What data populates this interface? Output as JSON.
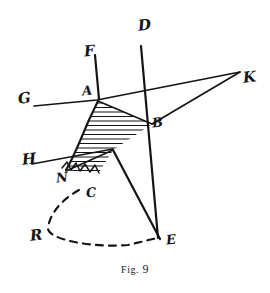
{
  "figure": {
    "caption_prefix": "Fig.",
    "caption_number": "9",
    "caption_full": "FIG. 9",
    "background_color": "#ffffff",
    "ink_color": "#141414",
    "width": 270,
    "height": 293
  },
  "labels": [
    {
      "id": "G",
      "text": "G",
      "x": 18,
      "y": 91,
      "role": "ray-endpoint-left"
    },
    {
      "id": "F",
      "text": "F",
      "x": 84,
      "y": 44,
      "role": "ray-endpoint-upper"
    },
    {
      "id": "A",
      "text": "A",
      "x": 82,
      "y": 84,
      "role": "vertex-point"
    },
    {
      "id": "D",
      "text": "D",
      "x": 138,
      "y": 18,
      "role": "ray-endpoint-top"
    },
    {
      "id": "K",
      "text": "K",
      "x": 243,
      "y": 70,
      "role": "convergence-point-right"
    },
    {
      "id": "B",
      "text": "B",
      "x": 152,
      "y": 116,
      "role": "vertex-point"
    },
    {
      "id": "H",
      "text": "H",
      "x": 22,
      "y": 152,
      "role": "ray-endpoint-lower-left"
    },
    {
      "id": "N",
      "text": "N",
      "x": 56,
      "y": 171,
      "role": "band-edge-point"
    },
    {
      "id": "C",
      "text": "C",
      "x": 86,
      "y": 186,
      "role": "curve-point"
    },
    {
      "id": "R",
      "text": "R",
      "x": 30,
      "y": 228,
      "role": "arc-point"
    },
    {
      "id": "E",
      "text": "E",
      "x": 166,
      "y": 233,
      "role": "apex-point-bottom"
    }
  ],
  "geometry": {
    "solid_lines": [
      {
        "name": "line-D-E",
        "points": "141,46 158,238"
      },
      {
        "name": "line-F-to-E",
        "points": "95,55 100,100 113,150 160,239"
      },
      {
        "name": "line-G-to-K",
        "points": "34,106 97,100 240,72"
      },
      {
        "name": "line-B-to-K",
        "points": "240,72 152,124"
      },
      {
        "name": "line-H-to-band",
        "points": "32,164 113,149"
      }
    ],
    "dashed_arc": {
      "name": "arc-C-R-E",
      "points": "79,190 60,202 46,222 52,240 90,247 130,244 157,238",
      "dash_pattern": "7,6"
    },
    "hatched_band": {
      "name": "refraction-band",
      "curve_left": "98,101 92,112 86,124 80,140 73,156 66,170",
      "converge_point": "152,124",
      "lower_converge": "113,150",
      "hatch_count": 16,
      "sawtooth_edge": "66,170 72,164 76,172 82,165 87,173 93,166 98,174"
    }
  }
}
